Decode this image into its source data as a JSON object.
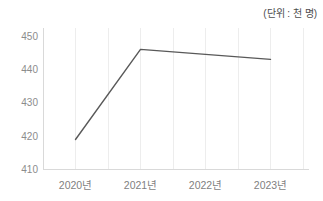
{
  "chart": {
    "unit_label": "(단위 : 천 명)",
    "colors": {
      "background": "#ffffff",
      "line": "#595959",
      "grid": "#ededed",
      "axis": "#d9d9d9",
      "tick_text": "#8c8c8c",
      "unit_text": "#4d4d4d"
    }
  },
  "chart_data": {
    "type": "line",
    "title": "",
    "xlabel": "",
    "ylabel": "",
    "unit": "(단위 : 천 명)",
    "categories": [
      "2020년",
      "2021년",
      "2022년",
      "2023년"
    ],
    "values": [
      419,
      446,
      444.5,
      443
    ],
    "yticks": [
      410,
      420,
      430,
      440,
      450
    ],
    "ylim": [
      410,
      452.4
    ],
    "grid": "vertical-only",
    "legend": "none",
    "markers": "none"
  }
}
